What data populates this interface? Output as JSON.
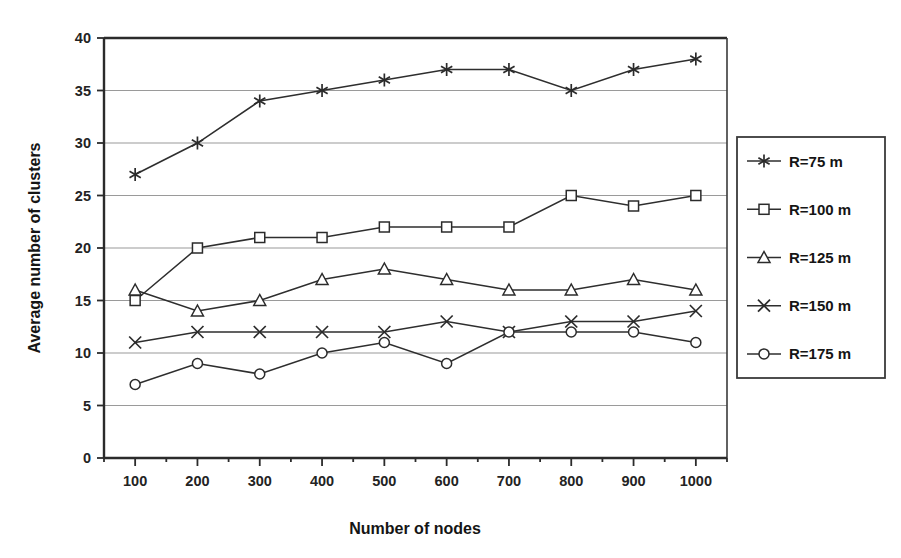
{
  "chart_data": {
    "type": "line",
    "title": "",
    "xlabel": "Number of nodes",
    "ylabel": "Average number of clusters",
    "x": [
      100,
      200,
      300,
      400,
      500,
      600,
      700,
      800,
      900,
      1000
    ],
    "xtick_labels": [
      "100",
      "200",
      "300",
      "400",
      "500",
      "600",
      "700",
      "800",
      "900",
      "1000"
    ],
    "ytick_labels": [
      "0",
      "5",
      "10",
      "15",
      "20",
      "25",
      "30",
      "35",
      "40"
    ],
    "yticks": [
      0,
      5,
      10,
      15,
      20,
      25,
      30,
      35,
      40
    ],
    "xlim": [
      50,
      1050
    ],
    "ylim": [
      0,
      40
    ],
    "grid": "horizontal",
    "legend_position": "right-outside",
    "series": [
      {
        "name": "R=75 m",
        "marker": "star",
        "values": [
          27,
          30,
          34,
          35,
          36,
          37,
          37,
          35,
          37,
          38
        ]
      },
      {
        "name": "R=100 m",
        "marker": "square",
        "values": [
          15,
          20,
          21,
          21,
          22,
          22,
          22,
          25,
          24,
          25
        ]
      },
      {
        "name": "R=125 m",
        "marker": "triangle",
        "values": [
          16,
          14,
          15,
          17,
          18,
          17,
          16,
          16,
          17,
          16
        ]
      },
      {
        "name": "R=150 m",
        "marker": "cross",
        "values": [
          11,
          12,
          12,
          12,
          12,
          13,
          12,
          13,
          13,
          14
        ]
      },
      {
        "name": "R=175 m",
        "marker": "circle",
        "values": [
          7,
          9,
          8,
          10,
          11,
          9,
          12,
          12,
          12,
          11
        ]
      }
    ]
  },
  "colors": {
    "line": "#2e2e2e",
    "grid": "#9a9a9a",
    "axis": "#2b2b2b",
    "background": "#ffffff"
  }
}
